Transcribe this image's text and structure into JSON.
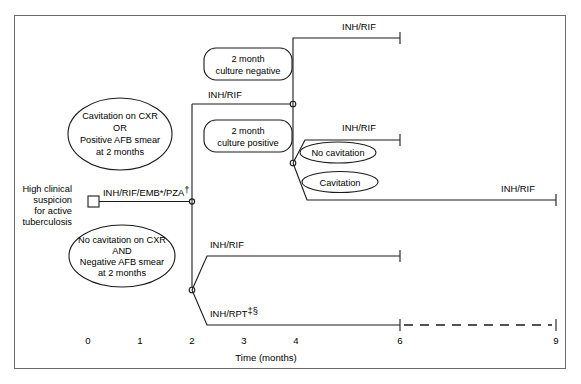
{
  "figure": {
    "type": "clinical-treatment-timeline-flowchart",
    "axis": {
      "title": "Time (months)",
      "ticks": [
        {
          "label": "0",
          "months": 0
        },
        {
          "label": "1",
          "months": 1
        },
        {
          "label": "2",
          "months": 2
        },
        {
          "label": "3",
          "months": 3
        },
        {
          "label": "4",
          "months": 4
        },
        {
          "label": "6",
          "months": 6
        },
        {
          "label": "9",
          "months": 9
        }
      ],
      "range_months": [
        0,
        9
      ]
    },
    "start": {
      "label_line1": "High clinical",
      "label_line2": "suspicion",
      "label_line3": "for active",
      "label_line4": "tuberculosis",
      "marker": "square-start-node"
    },
    "initial_phase": {
      "regimen": "INH/RIF/EMB*/PZA",
      "regimen_superscript": "†",
      "from_months": 0,
      "to_months": 2
    },
    "decision_ovals": [
      {
        "id": "cavitation-positive-smear",
        "lines": [
          "Cavitation on CXR",
          "OR",
          "Positive AFB smear",
          "at 2 months"
        ]
      },
      {
        "id": "no-cavitation-negative-smear",
        "lines": [
          "No cavitation on CXR",
          "AND",
          "Negative AFB smear",
          "at 2 months"
        ]
      }
    ],
    "culture_boxes": [
      {
        "id": "culture-negative",
        "line1": "2 month",
        "line2": "culture negative"
      },
      {
        "id": "culture-positive",
        "line1": "2 month",
        "line2": "culture positive"
      }
    ],
    "cavitation_ovals": [
      {
        "id": "no-cavitation",
        "label": "No cavitation"
      },
      {
        "id": "cavitation",
        "label": "Cavitation"
      }
    ],
    "continuation_branches": [
      {
        "id": "culture-negative-inh-rif",
        "regimen": "INH/RIF",
        "from_months": 2,
        "to_months": 6,
        "style": "solid"
      },
      {
        "id": "culture-positive-no-cavitation-inh-rif",
        "regimen": "INH/RIF",
        "from_months": 2,
        "to_months": 6,
        "style": "solid"
      },
      {
        "id": "culture-positive-cavitation-inh-rif",
        "regimen": "INH/RIF",
        "from_months": 2,
        "to_months": 9,
        "style": "solid"
      },
      {
        "id": "no-cavitation-inh-rif",
        "regimen": "INH/RIF",
        "from_months": 2,
        "to_months": 6,
        "style": "solid"
      },
      {
        "id": "no-cavitation-inh-rpt",
        "regimen": "INH/RPT",
        "regimen_superscript": "‡§",
        "from_months": 2,
        "to_months": 6,
        "extends_to_months": 9,
        "style": "solid-then-dashed"
      }
    ],
    "colors": {
      "ink": "#1a1a1a",
      "frame": "#6b6b6b",
      "background": "#ffffff"
    }
  }
}
